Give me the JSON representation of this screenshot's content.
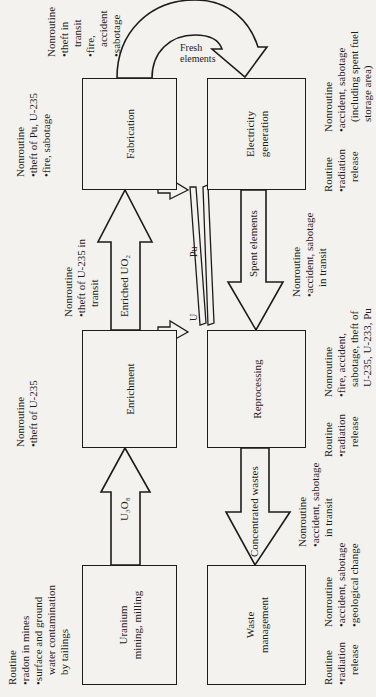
{
  "diagram": {
    "orientation": "rotated 90 degrees counter-clockwise",
    "title_partial": "… … …",
    "boxes": [
      {
        "id": "mining",
        "label_1": "Uranium",
        "label_2": "mining, milling"
      },
      {
        "id": "enrichment",
        "label_1": "Enrichment"
      },
      {
        "id": "fabrication",
        "label_1": "Fabrication"
      },
      {
        "id": "waste",
        "label_1": "Waste",
        "label_2": "management"
      },
      {
        "id": "reprocessing",
        "label_1": "Reprocessing"
      },
      {
        "id": "electricity",
        "label_1": "Electricity",
        "label_2": "generation"
      }
    ],
    "flows": {
      "u3o8": "U₃O₈",
      "enriched_uo2": "Enriched UO₂",
      "fresh_elements_1": "Fresh",
      "fresh_elements_2": "elements",
      "spent_elements": "Spent elements",
      "concentrated_wastes": "Concentrated wastes",
      "u": "U",
      "pu": "Pu"
    },
    "risks": {
      "mining_routine": {
        "heading": "Routine",
        "items": [
          "•radon in mines",
          "•surface and ground",
          "water contamination",
          "by tailings"
        ]
      },
      "enrichment_nonroutine": {
        "heading": "Nonroutine",
        "items": [
          "•theft of U-235"
        ]
      },
      "enriched_transit_nonroutine": {
        "heading": "Nonroutine",
        "items": [
          "•theft of U-235 in",
          "transit"
        ]
      },
      "fabrication_nonroutine": {
        "heading": "Nonroutine",
        "items": [
          "•theft of Pu, U-235",
          "•fire, sabotage"
        ]
      },
      "fresh_transit_nonroutine": {
        "heading": "Nonroutine",
        "items": [
          "•theft in",
          "transit",
          "•fire,",
          "accident",
          "•sabotage"
        ]
      },
      "waste_routine": {
        "heading": "Routine",
        "items": [
          "•radiation",
          "release"
        ]
      },
      "waste_nonroutine": {
        "heading": "Nonroutine",
        "items": [
          "•accident, sabotage",
          "•geological change"
        ]
      },
      "wastes_transit_nonroutine": {
        "heading": "Nonroutine",
        "items": [
          "•accident, sabotage",
          "in transit"
        ]
      },
      "reprocessing_routine": {
        "heading": "Routine",
        "items": [
          "•radiation",
          "release"
        ]
      },
      "reprocessing_nonroutine": {
        "heading": "Nonroutine",
        "items": [
          "•fire, accident,",
          "sabotage, theft of",
          "U-235, U-233, Pu"
        ]
      },
      "spent_transit_nonroutine": {
        "heading": "Nonroutine",
        "items": [
          "•accident, sabotage",
          "in transit"
        ]
      },
      "electricity_routine": {
        "heading": "Routine",
        "items": [
          "•radiation",
          "release"
        ]
      },
      "electricity_nonroutine": {
        "heading": "Nonroutine",
        "items": [
          "•accident, sabotage",
          "(including spent fuel",
          "storage area)"
        ]
      }
    }
  }
}
